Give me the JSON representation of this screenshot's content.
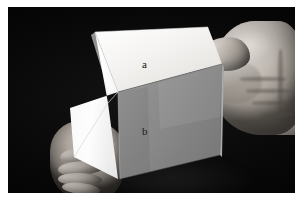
{
  "figure": {
    "kind": "photograph",
    "color_mode": "grayscale",
    "border_color": "#ffffff",
    "background_color": "#050505"
  },
  "labels": {
    "face_a": "a",
    "face_b": "b"
  },
  "palette": {
    "photo_background": "#050505",
    "page_background": "#ffffff",
    "face_a_paper": "#f0efed",
    "face_b_paper": "#8a8a8a",
    "face_left_paper": "#fbfbfb",
    "skin_highlight": "#d8d4cf",
    "skin_midtone": "#b5b5b5",
    "skin_shadow": "#5d5852",
    "label_text": "#111111"
  },
  "objects": {
    "cube": {
      "name": "paper cube",
      "visible_faces": [
        "a",
        "b",
        "left"
      ],
      "face_a_position": "top",
      "face_b_position": "front-right",
      "left_face_position": "front-left"
    },
    "right_hand": {
      "name": "right hand",
      "position": "upper right",
      "action": "gripping top-right corner"
    },
    "left_hand": {
      "name": "left hand",
      "position": "lower left",
      "action": "supporting bottom-left corner"
    }
  }
}
